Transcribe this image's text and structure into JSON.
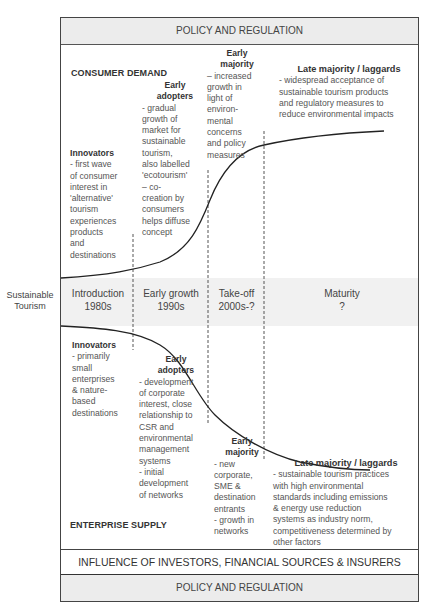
{
  "policy_top": {
    "label": "POLICY AND REGULATION"
  },
  "consumer": {
    "section_label": "CONSUMER DEMAND",
    "innovators": {
      "title": "Innovators",
      "lines": [
        "- first wave",
        "of consumer",
        "interest in",
        "'alternative'",
        "tourism",
        "experiences",
        "products",
        "and",
        "destinations"
      ]
    },
    "early_adopters": {
      "title_1": "Early",
      "title_2": "adopters",
      "lines": [
        "- gradual",
        "growth of",
        "market for",
        "sustainable",
        "tourism,",
        "also labelled",
        "'ecotourism'",
        "– co-",
        "creation by",
        "consumers",
        "helps diffuse",
        "concept"
      ]
    },
    "early_majority": {
      "title_1": "Early",
      "title_2": "majority",
      "lines": [
        "– increased",
        "growth in",
        "light of",
        "environ-",
        "mental",
        "concerns",
        "and policy",
        "measures"
      ]
    },
    "late_majority": {
      "title": "Late majority / laggards",
      "lines": [
        "- widespread acceptance of",
        "sustainable tourism products",
        "and regulatory measures to",
        "reduce environmental impacts"
      ]
    }
  },
  "stages": {
    "side_label_1": "Sustainable",
    "side_label_2": "Tourism",
    "items": [
      {
        "name": "Introduction",
        "period": "1980s"
      },
      {
        "name": "Early growth",
        "period": "1990s"
      },
      {
        "name": "Take-off",
        "period": "2000s-?"
      },
      {
        "name": "Maturity",
        "period": "?"
      }
    ]
  },
  "supply": {
    "section_label": "ENTERPRISE SUPPLY",
    "innovators": {
      "title": "Innovators",
      "lines": [
        "- primarily",
        "small",
        "enterprises",
        "& nature-",
        "based",
        "destinations"
      ]
    },
    "early_adopters": {
      "title_1": "Early",
      "title_2": "adopters",
      "lines": [
        "- development",
        "of corporate",
        "interest, close",
        "relationship to",
        "CSR and",
        "environmental",
        "management",
        "systems",
        "- initial",
        "development",
        "of networks"
      ]
    },
    "early_majority": {
      "title_1": "Early",
      "title_2": "majority",
      "lines": [
        "- new",
        "corporate,",
        "SME &",
        "destination",
        "entrants",
        "- growth in",
        "networks"
      ]
    },
    "late_majority": {
      "title": "Late majority / laggards",
      "lines": [
        "- sustainable tourism practices",
        "with high environmental",
        "standards including emissions",
        "& energy use reduction",
        "systems as industry norm,",
        "competitiveness determined by",
        "other factors"
      ]
    }
  },
  "influence": {
    "label": "INFLUENCE OF INVESTORS, FINANCIAL SOURCES & INSURERS"
  },
  "policy_bottom": {
    "label": "POLICY AND REGULATION"
  }
}
